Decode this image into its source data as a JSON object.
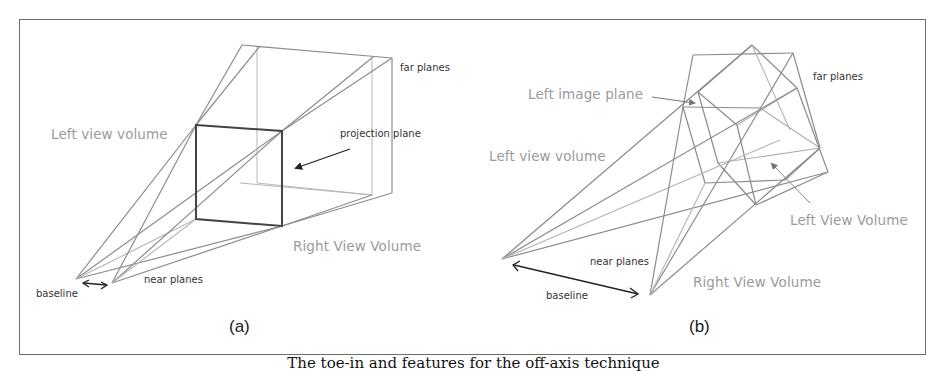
{
  "figure": {
    "caption": "The toe-in and features for the off-axis technique",
    "line_color": "#8a8a8a",
    "frame_color": "#6e6e6e",
    "label_color": "#9b9b9b"
  },
  "panel_a": {
    "tag": "(a)",
    "labels": {
      "left_view_volume": "Left view volume",
      "right_view_volume": "Right View Volume",
      "far_planes": "far planes",
      "projection_plane": "projection plane",
      "near_planes": "near planes",
      "baseline": "baseline"
    }
  },
  "panel_b": {
    "tag": "(b)",
    "labels": {
      "left_image_plane": "Left image plane",
      "left_view_volume": "Left view volume",
      "left_view_volume_arrow": "Left View Volume",
      "right_view_volume": "Right View Volume",
      "far_planes": "far planes",
      "near_planes": "near planes",
      "baseline": "baseline"
    }
  }
}
